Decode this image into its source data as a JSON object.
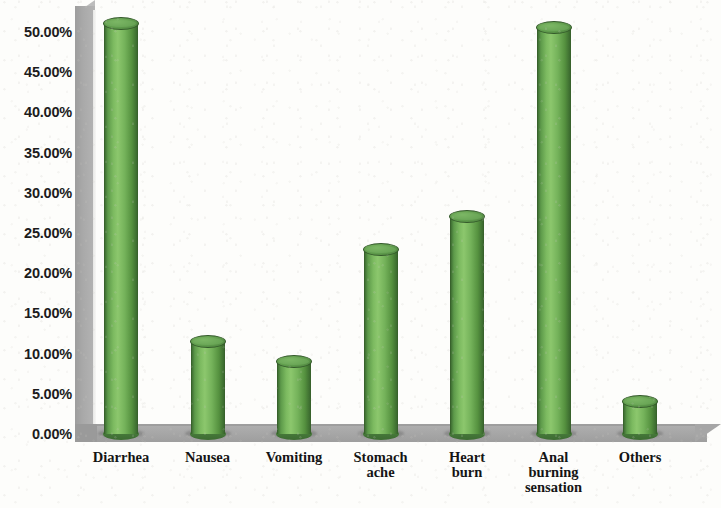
{
  "chart_data": {
    "type": "bar",
    "title": "",
    "subtitle": "",
    "xlabel": "",
    "ylabel": "",
    "categories": [
      "Diarrhea",
      "Nausea",
      "Vomiting",
      "Stomach\nache",
      "Heart\nburn",
      "Anal\nburning\nsensation",
      "Others"
    ],
    "values": [
      51.0,
      11.5,
      9.0,
      23.0,
      27.0,
      50.5,
      4.0
    ],
    "value_labels": [
      "51.00%",
      "11.50%",
      "9.00%",
      "23.00%",
      "27.00%",
      "50.50%",
      "4.00%"
    ],
    "ylim": [
      0,
      50
    ],
    "ytick_values": [
      0,
      5,
      10,
      15,
      20,
      25,
      30,
      35,
      40,
      45,
      50
    ],
    "ytick_labels": [
      "0.00%",
      "5.00%",
      "10.00%",
      "15.00%",
      "20.00%",
      "25.00%",
      "30.00%",
      "35.00%",
      "40.00%",
      "45.00%",
      "50.00%"
    ],
    "grid": false,
    "legend": false,
    "legend_position": "none",
    "style": "3d-cylinder",
    "series": [
      {
        "name": "Symptom frequency",
        "values": [
          51.0,
          11.5,
          9.0,
          23.0,
          27.0,
          50.5,
          4.0
        ]
      }
    ],
    "colors": {
      "bar_fill": "#6fae58",
      "bar_highlight": "#8cc76d",
      "bar_shade": "#3b6a2f",
      "bar_outline": "#33592a",
      "wall": "#a9a9a9",
      "floor": "#a6a6a6",
      "background": "#fdfdfb",
      "text": "#1b1b1b"
    }
  }
}
